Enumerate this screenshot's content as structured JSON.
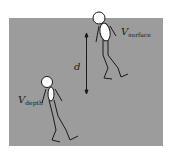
{
  "diagram": {
    "background_color": "#ffffff",
    "panel_color": "#9c9c9c",
    "figure_color": "#ffffff",
    "line_color": "#1a1a1a",
    "labels": {
      "distance": "d",
      "surface_main": "V",
      "surface_sub": "surface",
      "depth_main": "V",
      "depth_sub": "depth"
    },
    "figures": [
      {
        "name": "diver-surface",
        "label": "V_surface"
      },
      {
        "name": "diver-depth",
        "label": "V_depth"
      }
    ]
  }
}
